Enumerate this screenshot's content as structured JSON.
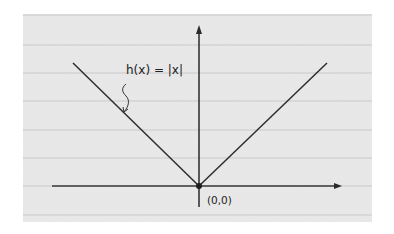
{
  "diagram": {
    "function_label": "h(x) = |x|",
    "origin_label": "(0,0)",
    "colors": {
      "paper": "#e9e9e9",
      "rule_line": "#c9c9c9",
      "ink": "#2a2a2a",
      "background": "#ffffff"
    },
    "ruled_lines_y": [
      45,
      73,
      101,
      130,
      158,
      215
    ],
    "axes": {
      "origin": [
        199,
        186
      ],
      "x_axis": {
        "from": [
          52,
          186
        ],
        "to": [
          342,
          186
        ],
        "arrow": "right"
      },
      "y_axis": {
        "from": [
          199,
          207
        ],
        "to": [
          199,
          25
        ],
        "arrow": "up"
      }
    },
    "curve": {
      "left_end": [
        73,
        63
      ],
      "vertex": [
        199,
        186
      ],
      "right_end": [
        327,
        63
      ]
    },
    "pointer": {
      "from": [
        126,
        84
      ],
      "to": [
        124,
        112
      ]
    }
  }
}
